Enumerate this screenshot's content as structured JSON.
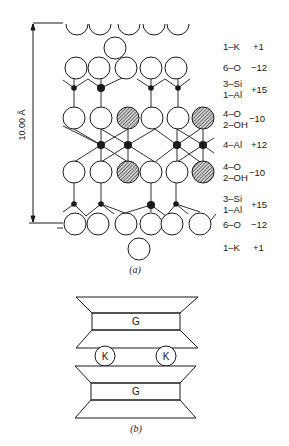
{
  "figure_a": {
    "caption": "(a)",
    "dimension_label": "10.00 Å",
    "layers": [
      {
        "composition": "1–K",
        "charge": "+1"
      },
      {
        "composition": "6–O",
        "charge": "−12"
      },
      {
        "composition_line1": "3–Si",
        "composition_line2": "1–Al",
        "charge": "+15"
      },
      {
        "composition_line1": "4–O",
        "composition_line2": "2–OH",
        "charge": "−10"
      },
      {
        "composition": "4–Al",
        "charge": "+12"
      },
      {
        "composition_line1": "4–O",
        "composition_line2": "2–OH",
        "charge": "−10"
      },
      {
        "composition_line1": "3–Si",
        "composition_line2": "1–Al",
        "charge": "+15"
      },
      {
        "composition": "6–O",
        "charge": "−12"
      },
      {
        "composition": "1–K",
        "charge": "+1"
      }
    ],
    "legend": {
      "open_circle": "oxygen",
      "hatched_circle": "hydroxyl",
      "filled_dot": "cation"
    }
  },
  "figure_b": {
    "caption": "(b)",
    "top_sheet_label": "G",
    "bottom_sheet_label": "G",
    "interlayer_ions": [
      "K",
      "K"
    ]
  },
  "colors": {
    "ink": "#1a1a1a",
    "background": "#ffffff",
    "hatch": "#555555"
  }
}
